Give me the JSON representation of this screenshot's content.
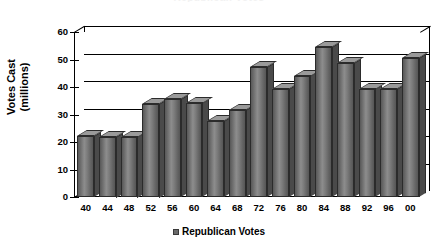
{
  "chart_data": {
    "type": "bar",
    "title": "Republican Votes",
    "xlabel": "",
    "ylabel": "Votes Cast (millions)",
    "ylabel_lines": [
      "Votes Cast",
      "(millions)"
    ],
    "categories": [
      "40",
      "44",
      "48",
      "52",
      "56",
      "60",
      "64",
      "68",
      "72",
      "76",
      "80",
      "84",
      "88",
      "92",
      "96",
      "00"
    ],
    "values": [
      22.3,
      22.0,
      22.0,
      34.0,
      35.6,
      34.2,
      27.8,
      31.8,
      47.2,
      39.1,
      43.9,
      54.5,
      48.9,
      39.1,
      39.2,
      50.5
    ],
    "series": [
      {
        "name": "Republican Votes",
        "values": [
          22.3,
          22.0,
          22.0,
          34.0,
          35.6,
          34.2,
          27.8,
          31.8,
          47.2,
          39.1,
          43.9,
          54.5,
          48.9,
          39.1,
          39.2,
          50.5
        ]
      }
    ],
    "ylim": [
      0,
      60
    ],
    "ytick_values": [
      0,
      10,
      20,
      30,
      40,
      50,
      60
    ],
    "ytick_labels": [
      "0",
      "10",
      "20",
      "30",
      "40",
      "50",
      "60"
    ],
    "grid": true,
    "legend_position": "bottom",
    "bar_color": "#6e6e6e",
    "axis_color": "#000000"
  },
  "legend": {
    "entries": [
      {
        "label": "Republican Votes",
        "swatch_color": "#6a6a6a"
      }
    ]
  }
}
